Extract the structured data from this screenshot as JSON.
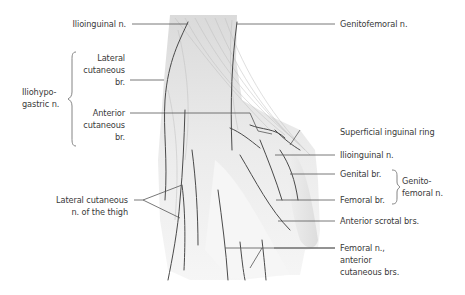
{
  "figure": {
    "labels": {
      "ilioinguinal_top": "Ilioinguinal n.",
      "genitofemoral": "Genitofemoral n.",
      "iliohypogastric": "Iliohypo-\ngastric n.",
      "lateral_cutaneous_br": "Lateral\ncutaneous\nbr.",
      "anterior_cutaneous_br": "Anterior\ncutaneous\nbr.",
      "superficial_inguinal_ring": "Superficial inguinal ring",
      "ilioinguinal_right": "Ilioinguinal n.",
      "genital_br": "Genital br.",
      "femoral_br": "Femoral br.",
      "genitofemoral_group": "Genito-\nfemoral n.",
      "anterior_scrotal_brs": "Anterior scrotal brs.",
      "femoral_anterior_cutaneous": "Femoral n.,\nanterior\ncutaneous brs.",
      "lateral_cutaneous_thigh": "Lateral cutaneous\nn. of the thigh"
    },
    "colors": {
      "text": "#3a3a3a",
      "leader": "#555555",
      "nerve": "#4a4a4a",
      "tissue": "#e6e6e6"
    }
  }
}
